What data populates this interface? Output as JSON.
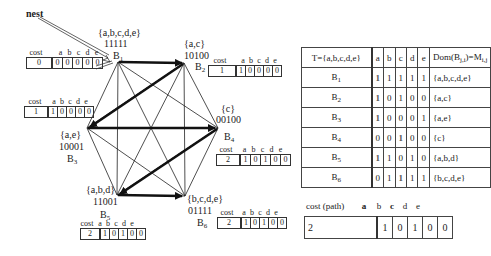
{
  "annotation": {
    "label": "nest"
  },
  "bit_headers": [
    "a",
    "b",
    "c",
    "d",
    "e"
  ],
  "cost_header": "cost",
  "nodes": [
    {
      "id": "B1",
      "name": "B",
      "sub": "1",
      "set": "{a,b,c,d,e}",
      "mark": "a",
      "bits": "11111",
      "cost": "0",
      "cost_bits": [
        "0",
        "0",
        "0",
        "0",
        "0"
      ]
    },
    {
      "id": "B2",
      "name": "B",
      "sub": "2",
      "set": "{a,c}",
      "mark": "a",
      "bits": "10100",
      "cost": "1",
      "cost_bits": [
        "1",
        "0",
        "0",
        "0",
        "0"
      ]
    },
    {
      "id": "B3",
      "name": "B",
      "sub": "3",
      "set": "{a,e}",
      "mark": "a",
      "bits": "10001",
      "cost": "1",
      "cost_bits": [
        "1",
        "0",
        "0",
        "0",
        "0"
      ]
    },
    {
      "id": "B4",
      "name": "B",
      "sub": "4",
      "set": "{c}",
      "mark": "c",
      "bits": "00100",
      "cost": "2",
      "cost_bits": [
        "1",
        "0",
        "1",
        "0",
        "0"
      ]
    },
    {
      "id": "B5",
      "name": "B",
      "sub": "5",
      "set": "{a,b,d}",
      "mark": "a",
      "bits": "11001",
      "cost": "2",
      "cost_bits": [
        "1",
        "0",
        "1",
        "0",
        "0"
      ]
    },
    {
      "id": "B6",
      "name": "B",
      "sub": "6",
      "set": "{b,c,d,e}",
      "mark": "c",
      "bits": "01111",
      "cost": "2",
      "cost_bits": [
        "1",
        "0",
        "1",
        "0",
        "0"
      ]
    }
  ],
  "node_labels": {
    "B1": {
      "set": "{a,b,c,d,e}",
      "bits": "11111"
    },
    "B2": {
      "set": "{a,c}",
      "bits": "10100"
    },
    "B3": {
      "set": "{a,e}",
      "bits": "10001"
    },
    "B4": {
      "set": "{c}",
      "bits": "00100"
    },
    "B5": {
      "set": "{a,b,d}",
      "bits": "11001"
    },
    "B6": {
      "set": "{b,c,d,e}",
      "bits": "01111"
    }
  },
  "path_edges": [
    [
      "B1",
      "B2"
    ],
    [
      "B2",
      "B3"
    ],
    [
      "B3",
      "B4"
    ],
    [
      "B4",
      "B5"
    ],
    [
      "B5",
      "B6"
    ]
  ],
  "table": {
    "header": {
      "name": "T={a,b,c,d,e}",
      "cols": [
        "a",
        "b",
        "c",
        "d",
        "e"
      ],
      "dom": "Dom(B_ji)=M_i,j"
    },
    "rows": [
      {
        "name": "B",
        "sub": "1",
        "bits": [
          "1",
          "1",
          "1",
          "1",
          "1"
        ],
        "dom": "{a,b,c,d,e}",
        "marked": [
          0
        ]
      },
      {
        "name": "B",
        "sub": "2",
        "bits": [
          "1",
          "0",
          "1",
          "0",
          "0"
        ],
        "dom": "{a,c}",
        "marked": [
          0
        ]
      },
      {
        "name": "B",
        "sub": "3",
        "bits": [
          "1",
          "0",
          "0",
          "0",
          "1"
        ],
        "dom": "{a,e}",
        "marked": [
          0
        ]
      },
      {
        "name": "B",
        "sub": "4",
        "bits": [
          "0",
          "0",
          "1",
          "0",
          "0"
        ],
        "dom": "{c}",
        "marked": [
          2
        ]
      },
      {
        "name": "B",
        "sub": "5",
        "bits": [
          "1",
          "1",
          "0",
          "1",
          "0"
        ],
        "dom": "{a,b,d}",
        "marked": [
          0
        ]
      },
      {
        "name": "B",
        "sub": "6",
        "bits": [
          "0",
          "1",
          "1",
          "1",
          "1"
        ],
        "dom": "{b,c,d,e}",
        "marked": [
          2
        ]
      }
    ]
  },
  "path_result": {
    "label": "cost (path)",
    "cols": [
      "a",
      "b",
      "c",
      "d",
      "e"
    ],
    "cost": "2",
    "bits": [
      "1",
      "0",
      "1",
      "0",
      "0"
    ]
  }
}
